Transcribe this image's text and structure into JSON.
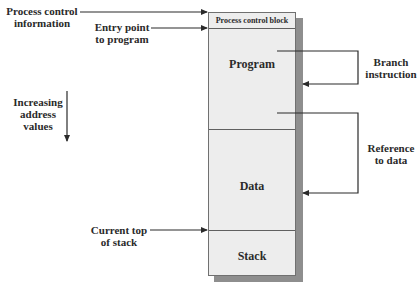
{
  "diagram": {
    "type": "process-image-memory-layout",
    "box": {
      "segments": [
        {
          "label": "Process control block"
        },
        {
          "label": "Program"
        },
        {
          "label": "Data"
        },
        {
          "label": "Stack"
        }
      ]
    },
    "left_labels": {
      "process_control_information": [
        "Process control",
        "information"
      ],
      "entry_point": [
        "Entry point",
        "to program"
      ],
      "increasing_address": [
        "Increasing",
        "address",
        "values"
      ],
      "current_top_of_stack": [
        "Current top",
        "of stack"
      ]
    },
    "right_labels": {
      "branch_instruction": [
        "Branch",
        "instruction"
      ],
      "reference_to_data": [
        "Reference",
        "to data"
      ]
    },
    "colors": {
      "box_fill": "#ededed",
      "shadow": "#8e8e8e",
      "line": "#2a2a2a"
    }
  }
}
